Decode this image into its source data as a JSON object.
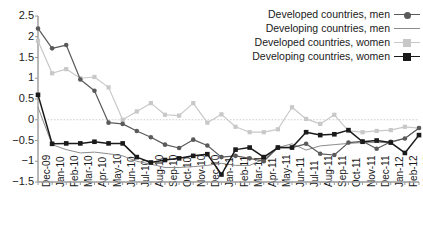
{
  "chart_data": {
    "type": "line",
    "title": "",
    "subtitle": "",
    "xlabel": "",
    "ylabel": "",
    "ylim": [
      -1.5,
      2.5
    ],
    "yticks": [
      2.5,
      2,
      1.5,
      1,
      0.5,
      0,
      -0.5,
      -1,
      -1.5
    ],
    "ytick_labels": [
      "2.5",
      "2",
      "1.5",
      "1",
      "0.5",
      "0",
      "−0.5",
      "−1",
      "−1.5"
    ],
    "grid": false,
    "zero_line": true,
    "zero_line_style": "dotted",
    "legend_position": "top-right",
    "categories": [
      "Dec-09",
      "Jan-10",
      "Feb-10",
      "Mar-10",
      "Apr-10",
      "May-10",
      "Jun-10",
      "Jul-10",
      "Aug-10",
      "Sep-10",
      "Oct-10",
      "Nov-10",
      "Dec-10",
      "Jan-11",
      "Feb-11",
      "Mar-11",
      "Apr-11",
      "May-11",
      "Jun-11",
      "Jul-11",
      "Aug-11",
      "Sep-11",
      "Oct-11",
      "Nov-11",
      "Dec-11",
      "Jan-12",
      "Feb-12",
      "Mar-12"
    ],
    "series": [
      {
        "name": "Developed countries, men",
        "color": "#5a5a5a",
        "marker": "circle",
        "values": [
          2.2,
          1.72,
          1.8,
          0.97,
          0.7,
          -0.07,
          -0.1,
          -0.27,
          -0.42,
          -0.6,
          -0.68,
          -0.48,
          -0.62,
          -0.9,
          -0.87,
          -0.93,
          -1.0,
          -0.67,
          -0.67,
          -0.58,
          -0.82,
          -0.85,
          -0.55,
          -0.52,
          -0.7,
          -0.53,
          -0.45,
          -0.2
        ]
      },
      {
        "name": "Developing countries, men",
        "color": "#8c8c8c",
        "marker": "none",
        "values": [
          0.3,
          -0.6,
          -0.72,
          -0.8,
          -0.78,
          -0.82,
          -0.87,
          -1.0,
          -1.07,
          -1.15,
          -1.15,
          -1.13,
          -1.1,
          -1.05,
          -1.1,
          -1.1,
          -0.95,
          -0.67,
          -0.58,
          -0.73,
          -0.63,
          -0.6,
          -0.57,
          -0.55,
          -0.55,
          -0.55,
          -0.45,
          -0.2
        ]
      },
      {
        "name": "Developed countries, women",
        "color": "#c8c8c8",
        "marker": "square",
        "values": [
          1.9,
          1.12,
          1.22,
          1.0,
          1.03,
          0.78,
          0.0,
          0.2,
          0.4,
          0.12,
          0.1,
          0.4,
          -0.07,
          0.13,
          -0.17,
          -0.3,
          -0.3,
          -0.23,
          0.3,
          0.02,
          -0.1,
          0.12,
          -0.27,
          -0.3,
          -0.27,
          -0.25,
          -0.17,
          -0.2
        ]
      },
      {
        "name": "Developing countries, women",
        "color": "#1a1a1a",
        "marker": "square",
        "values": [
          0.6,
          -0.58,
          -0.57,
          -0.57,
          -0.53,
          -0.57,
          -0.57,
          -0.9,
          -1.03,
          -0.97,
          -0.93,
          -0.87,
          -0.83,
          -1.32,
          -0.72,
          -0.67,
          -0.9,
          -0.67,
          -0.67,
          -0.3,
          -0.37,
          -0.35,
          -0.25,
          -0.53,
          -0.5,
          -0.55,
          -0.8,
          -0.37
        ]
      }
    ]
  },
  "legend": {
    "items": [
      {
        "label": "Developed countries, men"
      },
      {
        "label": "Developing countries, men"
      },
      {
        "label": "Developed countries, women"
      },
      {
        "label": "Developing countries, women"
      }
    ]
  }
}
